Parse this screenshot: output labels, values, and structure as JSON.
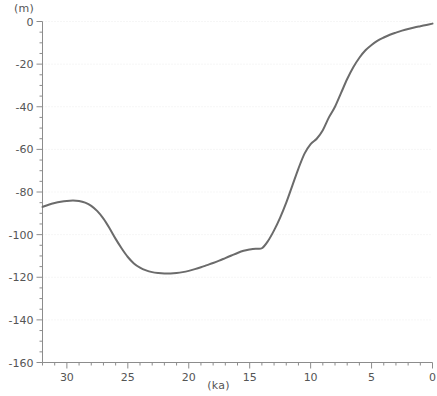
{
  "chart_data": {
    "type": "line",
    "title": "",
    "subtitle": "",
    "xlabel": "(ka)",
    "ylabel": "(m)",
    "xlim": [
      32,
      0
    ],
    "ylim": [
      -160,
      0
    ],
    "x_reversed": true,
    "grid": true,
    "grid_style": "dotted",
    "legend": "none",
    "x_ticks_major": [
      30,
      25,
      20,
      15,
      10,
      5,
      0
    ],
    "x_tick_labels": [
      "30",
      "25",
      "20",
      "15",
      "10",
      "5",
      "0"
    ],
    "x_tick_minor_step": 1,
    "y_ticks_major": [
      0,
      -20,
      -40,
      -60,
      -80,
      -100,
      -120,
      -140,
      -160
    ],
    "y_tick_labels": [
      "0",
      "-20",
      "-40",
      "-60",
      "-80",
      "-100",
      "-120",
      "-140",
      "-160"
    ],
    "y_tick_minor_step": 5,
    "series": [
      {
        "name": "relative sea level",
        "color": "#6b6b6b",
        "line_width": 2,
        "x": [
          32.0,
          31.5,
          31.0,
          30.5,
          30.0,
          29.5,
          29.0,
          28.5,
          28.0,
          27.5,
          27.0,
          26.5,
          26.0,
          25.5,
          25.0,
          24.5,
          24.0,
          23.5,
          23.0,
          22.5,
          22.0,
          21.5,
          21.0,
          20.5,
          20.0,
          19.5,
          19.0,
          18.5,
          18.0,
          17.5,
          17.0,
          16.5,
          16.0,
          15.5,
          15.0,
          14.5,
          14.0,
          13.5,
          13.0,
          12.5,
          12.0,
          11.5,
          11.0,
          10.5,
          10.0,
          9.5,
          9.0,
          8.5,
          8.0,
          7.5,
          7.0,
          6.5,
          6.0,
          5.5,
          5.0,
          4.5,
          4.0,
          3.5,
          3.0,
          2.5,
          2.0,
          1.5,
          1.0,
          0.5,
          0.0
        ],
        "y": [
          -87.0,
          -86.0,
          -85.2,
          -84.6,
          -84.2,
          -84.0,
          -84.2,
          -85.0,
          -86.5,
          -89.0,
          -92.5,
          -97.0,
          -102.0,
          -106.5,
          -110.5,
          -113.5,
          -115.5,
          -116.8,
          -117.6,
          -118.0,
          -118.2,
          -118.2,
          -118.0,
          -117.6,
          -117.0,
          -116.2,
          -115.3,
          -114.3,
          -113.3,
          -112.2,
          -111.0,
          -109.8,
          -108.6,
          -107.6,
          -107.0,
          -106.6,
          -106.4,
          -103.0,
          -98.0,
          -92.0,
          -85.0,
          -77.0,
          -69.0,
          -62.0,
          -57.5,
          -55.0,
          -51.0,
          -45.0,
          -40.0,
          -33.5,
          -27.0,
          -21.5,
          -17.0,
          -13.5,
          -11.0,
          -9.0,
          -7.5,
          -6.2,
          -5.2,
          -4.3,
          -3.5,
          -2.8,
          -2.2,
          -1.6,
          -1.0
        ]
      }
    ],
    "annotations": []
  },
  "colors": {
    "line": "#6b6b6b",
    "axis": "#8c8c8c",
    "grid": "#ededed",
    "tick_text": "#555555",
    "background": "#ffffff"
  }
}
